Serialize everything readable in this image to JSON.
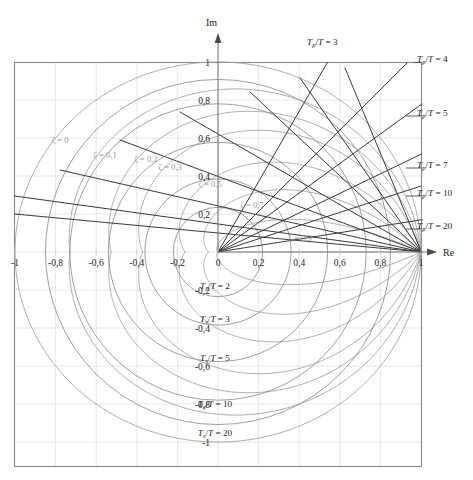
{
  "figure": {
    "title": "",
    "axes": {
      "x_name": "Re",
      "y_name": "Im"
    }
  },
  "chart_data": {
    "type": "line",
    "title": "",
    "subtitle": "",
    "xlabel": "Re",
    "ylabel": "Im",
    "xlim": [
      -1.08,
      1.08
    ],
    "ylim": [
      -1.08,
      1.08
    ],
    "grid": true,
    "legend_position": "none",
    "x_ticks": [
      "-1",
      "-0,8",
      "-0,6",
      "-0,4",
      "-0,2",
      "0",
      "0,2",
      "0,4",
      "0,6",
      "0,8",
      "1"
    ],
    "x_tick_values": [
      -1,
      -0.8,
      -0.6,
      -0.4,
      -0.2,
      0,
      0.2,
      0.4,
      0.6,
      0.8,
      1
    ],
    "y_ticks": [
      "1",
      "0,8",
      "0,6",
      "0,4",
      "0,2",
      "-0,2",
      "-0,4",
      "-0,6",
      "-0,8",
      "-1"
    ],
    "y_tick_values": [
      1,
      0.8,
      0.6,
      0.4,
      0.2,
      -0.2,
      -0.4,
      -0.6,
      -0.8,
      -1
    ],
    "series": [
      {
        "name": "zeta = 0",
        "zeta": 0.0,
        "label": "ζ = 0"
      },
      {
        "name": "zeta = 0,1",
        "zeta": 0.1,
        "label": "ζ = 0,1"
      },
      {
        "name": "zeta = 0,2",
        "zeta": 0.2,
        "label": "ζ = 0,2"
      },
      {
        "name": "zeta = 0,3",
        "zeta": 0.3,
        "label": "ζ = 0,3"
      },
      {
        "name": "zeta = 0,5",
        "zeta": 0.5,
        "label": "ζ = 0,5"
      },
      {
        "name": "zeta = 0,7",
        "zeta": 0.7,
        "label": "ζ = 0,7"
      },
      {
        "name": "zeta = 0,9",
        "zeta": 0.9,
        "label": "ζ = 0,9"
      }
    ],
    "settling_time_circles": [
      {
        "ratio": 2,
        "radius": 0.22
      },
      {
        "ratio": 3,
        "radius": 0.36
      },
      {
        "ratio": 5,
        "radius": 0.54
      },
      {
        "ratio": 10,
        "radius": 0.73
      },
      {
        "ratio": 20,
        "radius": 0.85
      }
    ],
    "peak_time_rays": [
      {
        "ratio": 3,
        "angle_deg": 60
      },
      {
        "ratio": 4,
        "angle_deg": 45
      },
      {
        "ratio": 5,
        "angle_deg": 36
      },
      {
        "ratio": 7,
        "angle_deg": 25.7
      },
      {
        "ratio": 10,
        "angle_deg": 18
      },
      {
        "ratio": 20,
        "angle_deg": 9
      }
    ]
  },
  "labels": {
    "im_axis": "Im",
    "re_axis": "Re",
    "x_ticks": [
      {
        "text": "-1",
        "value": -1.0
      },
      {
        "text": "-0,8",
        "value": -0.8
      },
      {
        "text": "-0,6",
        "value": -0.6
      },
      {
        "text": "-0,4",
        "value": -0.4
      },
      {
        "text": "-0,2",
        "value": -0.2
      },
      {
        "text": "0",
        "value": 0.0
      },
      {
        "text": "0,2",
        "value": 0.2
      },
      {
        "text": "0,4",
        "value": 0.4
      },
      {
        "text": "0,6",
        "value": 0.6
      },
      {
        "text": "0,8",
        "value": 0.8
      },
      {
        "text": "1",
        "value": 1.0
      }
    ],
    "y_ticks": [
      {
        "text": "1",
        "value": 1.0
      },
      {
        "text": "0,8",
        "value": 0.8
      },
      {
        "text": "0,6",
        "value": 0.6
      },
      {
        "text": "0,4",
        "value": 0.4
      },
      {
        "text": "0,2",
        "value": 0.2
      },
      {
        "text": "-0,2",
        "value": -0.2
      },
      {
        "text": "-0,4",
        "value": -0.4
      },
      {
        "text": "-0,6",
        "value": -0.6
      },
      {
        "text": "-0,8",
        "value": -0.8
      },
      {
        "text": "-1",
        "value": -1.0
      }
    ],
    "zeta": [
      {
        "text": "ζ = 0",
        "x": 60,
        "y": 143
      },
      {
        "text": "ζ = 0,1",
        "x": 105,
        "y": 158
      },
      {
        "text": "ζ = 0,2",
        "x": 146,
        "y": 162
      },
      {
        "text": "ζ = 0,3",
        "x": 170,
        "y": 170
      },
      {
        "text": "ζ = 0,5",
        "x": 210,
        "y": 187
      },
      {
        "text": "ζ = 0,7",
        "x": 252,
        "y": 208
      },
      {
        "text": "ζ = 0,9",
        "x": 300,
        "y": 241
      }
    ],
    "ts": [
      {
        "num": "2",
        "x": 215,
        "y": 289
      },
      {
        "num": "3",
        "x": 215,
        "y": 322
      },
      {
        "num": "5",
        "x": 215,
        "y": 361
      },
      {
        "num": "10",
        "x": 215,
        "y": 407
      },
      {
        "num": "20",
        "x": 215,
        "y": 436
      }
    ],
    "tp": [
      {
        "num": "3",
        "x": 307,
        "y": 45,
        "anchor": "start"
      },
      {
        "num": "4",
        "x": 417,
        "y": 62,
        "anchor": "start"
      },
      {
        "num": "5",
        "x": 417,
        "y": 116,
        "anchor": "start"
      },
      {
        "num": "7",
        "x": 417,
        "y": 168,
        "anchor": "start"
      },
      {
        "num": "10",
        "x": 417,
        "y": 196,
        "anchor": "start"
      },
      {
        "num": "20",
        "x": 417,
        "y": 229,
        "anchor": "start"
      }
    ],
    "symbols": {
      "T": "T",
      "sub_p": "p",
      "sub_s": "s",
      "slash": "/",
      "equals": "=",
      "zeta": "ζ"
    }
  },
  "colors": {
    "frame": "#8a8a8a",
    "grid": "#e2e2e4",
    "zeta_curve": "#9a9a9a",
    "zeta_text": "#9b9b9b",
    "ts_circle": "#8f8f8f",
    "tp_ray": "#3a3a3a",
    "text": "#1b1b1b",
    "background": "#ffffff"
  }
}
